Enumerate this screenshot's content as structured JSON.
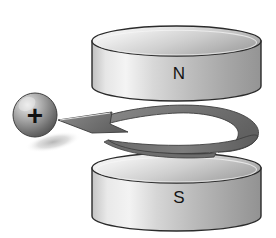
{
  "illustration": {
    "title": "Positive charge between magnet poles",
    "background_color": "#ffffff",
    "width": 276,
    "height": 238
  },
  "magnets": [
    {
      "id": "top-magnet",
      "pole_label": "N",
      "pole_name": "north",
      "position": "top",
      "label_x": 179,
      "label_y": 79,
      "geometry": {
        "left": 92,
        "right": 261,
        "top_ellipse_cy": 41,
        "bottom_ellipse_cy": 86,
        "rx": 84.5,
        "ry": 15
      },
      "colors": {
        "top_face_light": "#f2f2f2",
        "top_face_dark": "#b8b8b8",
        "body_light": "#efefef",
        "body_mid": "#c9c9c9",
        "body_dark": "#9a9a9a",
        "outline": "#2b2b2b"
      }
    },
    {
      "id": "bottom-magnet",
      "pole_label": "S",
      "pole_name": "south",
      "position": "bottom",
      "label_x": 179,
      "label_y": 203,
      "geometry": {
        "left": 92,
        "right": 261,
        "top_ellipse_cy": 168,
        "bottom_ellipse_cy": 216,
        "rx": 84.5,
        "ry": 15
      },
      "colors": {
        "top_face_light": "#f2f2f2",
        "top_face_dark": "#b8b8b8",
        "body_light": "#efefef",
        "body_mid": "#c9c9c9",
        "body_dark": "#9a9a9a",
        "outline": "#2b2b2b"
      }
    }
  ],
  "charge": {
    "id": "positive-charge",
    "sign": "+",
    "polarity": "positive",
    "center_x": 35,
    "center_y": 115,
    "radius": 22,
    "colors": {
      "highlight": "#e8e8e8",
      "mid": "#a6a6a6",
      "shade": "#5e5e5e",
      "edge": "#454545",
      "sign": "#111111"
    },
    "shadow": {
      "center_x": 53,
      "center_y": 142,
      "rx": 28,
      "ry": 9,
      "color": "#c4c4c4",
      "rotation": -12
    }
  },
  "motion_arrow": {
    "id": "spiral-motion-arrow",
    "description": "helical spiral ribbon arrow pointing left toward the charge",
    "direction": "left",
    "fill_light": "#8e8e8e",
    "fill_dark": "#5a5a5a",
    "outline": "#3a3a3a",
    "tip_x": 58,
    "tip_y": 120
  }
}
